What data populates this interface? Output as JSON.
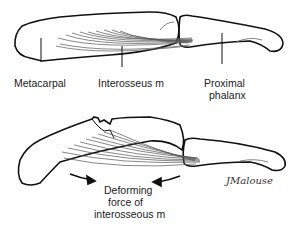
{
  "diagram": {
    "top_panel": {
      "labels": {
        "metacarpal": "Metacarpal",
        "interosseus": "Interosseus m",
        "proximal_line1": "Proximal",
        "proximal_line2": "phalanx"
      }
    },
    "bottom_panel": {
      "labels": {
        "force_line1": "Deforming",
        "force_line2": "force of",
        "force_line3": "interosseous m"
      },
      "signature": "JMalouse"
    },
    "colors": {
      "line": "#111111",
      "muscle": "#555555",
      "background": "#ffffff"
    }
  }
}
